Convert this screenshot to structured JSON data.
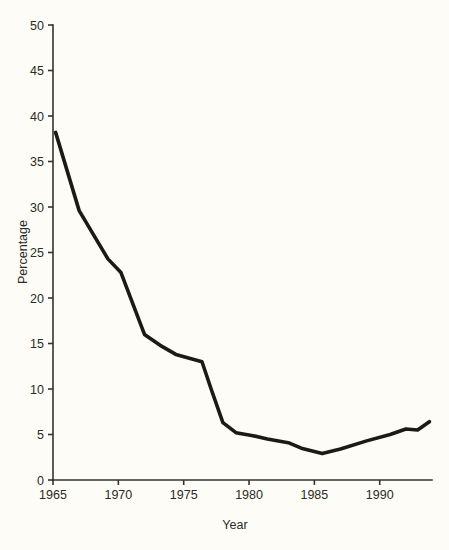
{
  "figure": {
    "background_color": "#fdfcf6",
    "line_color": "#1c1a14",
    "axis_color": "#35332c"
  },
  "chart_data": {
    "type": "line",
    "title": "",
    "subtitle": "",
    "xlabel": "Year",
    "ylabel": "Percentage",
    "xlim": [
      1965,
      1994
    ],
    "ylim": [
      0,
      50
    ],
    "xticks": [
      1965,
      1970,
      1975,
      1980,
      1985,
      1990
    ],
    "xtick_labels": [
      "1965",
      "1970",
      "1975",
      "1980",
      "1985",
      "1990"
    ],
    "yticks": [
      0,
      5,
      10,
      15,
      20,
      25,
      30,
      35,
      40,
      45,
      50
    ],
    "ytick_labels": [
      "0",
      "5",
      "10",
      "15",
      "20",
      "25",
      "30",
      "35",
      "40",
      "45",
      "50"
    ],
    "grid": false,
    "legend": false,
    "legend_position": "none",
    "annotations": [],
    "series": [
      {
        "name": "Percentage",
        "x": [
          1965.2,
          1967.0,
          1969.2,
          1970.2,
          1972.0,
          1973.2,
          1974.4,
          1976.4,
          1977.1,
          1978.0,
          1979.0,
          1980.2,
          1981.4,
          1983.0,
          1984.0,
          1985.6,
          1987.0,
          1989.0,
          1990.8,
          1992.0,
          1992.9,
          1993.8
        ],
        "y": [
          38.2,
          29.6,
          24.3,
          22.8,
          16.0,
          14.8,
          13.8,
          13.0,
          10.0,
          6.3,
          5.2,
          4.9,
          4.5,
          4.1,
          3.5,
          2.9,
          3.4,
          4.3,
          5.0,
          5.6,
          5.5,
          6.4
        ]
      }
    ]
  }
}
